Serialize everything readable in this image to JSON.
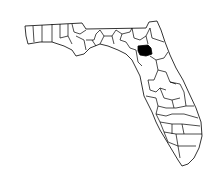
{
  "map": {
    "region": "Florida",
    "subdivision": "counties",
    "highlighted_county": "Alachua",
    "colors": {
      "background": "#ffffff",
      "outline": "#000000",
      "highlight": "#000000"
    }
  }
}
